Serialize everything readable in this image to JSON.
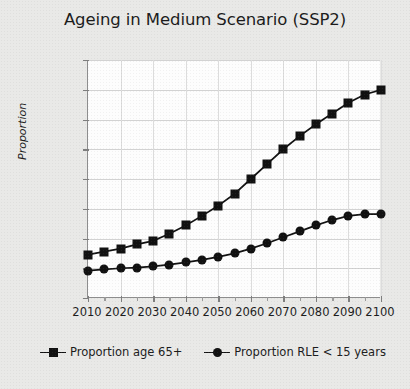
{
  "chart_data": {
    "type": "line",
    "title": "Ageing in Medium Scenario (SSP2)",
    "xlabel": "",
    "ylabel": "Proportion",
    "xlim": [
      2010,
      2100
    ],
    "ylim": [
      0.0,
      0.4
    ],
    "ytick_labels": [
      "0.400",
      "0.350",
      "0.300",
      "0.250",
      "0.200",
      "0.150",
      "0.100",
      "0.050",
      "0.000"
    ],
    "ytick_values": [
      0.4,
      0.35,
      0.3,
      0.25,
      0.2,
      0.15,
      0.1,
      0.05,
      0.0
    ],
    "xtick_labels": [
      "2010",
      "2020",
      "2030",
      "2040",
      "2050",
      "2060",
      "2070",
      "2080",
      "2090",
      "2100"
    ],
    "xtick_values": [
      2010,
      2020,
      2030,
      2040,
      2050,
      2060,
      2070,
      2080,
      2090,
      2100
    ],
    "grid": true,
    "legend_position": "bottom",
    "marker_interval_years": 5,
    "x": [
      2010,
      2015,
      2020,
      2025,
      2030,
      2035,
      2040,
      2045,
      2050,
      2055,
      2060,
      2065,
      2070,
      2075,
      2080,
      2085,
      2090,
      2095,
      2100
    ],
    "series": [
      {
        "name": "Proportion age 65+",
        "marker": "square",
        "color": "#111111",
        "values": [
          0.073,
          0.078,
          0.083,
          0.09,
          0.096,
          0.108,
          0.122,
          0.138,
          0.155,
          0.175,
          0.2,
          0.225,
          0.25,
          0.272,
          0.292,
          0.31,
          0.328,
          0.342,
          0.35
        ]
      },
      {
        "name": "Proportion RLE < 15 years",
        "marker": "circle",
        "color": "#111111",
        "values": [
          0.046,
          0.048,
          0.05,
          0.051,
          0.053,
          0.056,
          0.06,
          0.064,
          0.069,
          0.075,
          0.083,
          0.092,
          0.102,
          0.112,
          0.122,
          0.131,
          0.138,
          0.141,
          0.141
        ]
      }
    ]
  },
  "legend": {
    "items": [
      {
        "label": "Proportion age 65+",
        "marker": "square-marker"
      },
      {
        "label": "Proportion RLE < 15 years",
        "marker": "circle-marker"
      }
    ]
  }
}
